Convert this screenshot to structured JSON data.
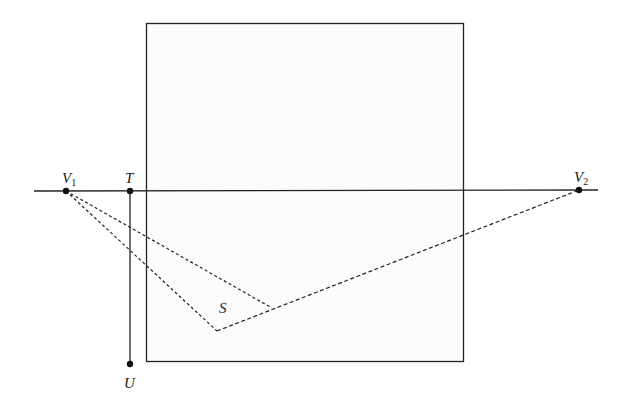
{
  "diagram": {
    "type": "two-point perspective construction",
    "colors": {
      "line": "#222222",
      "frame_fill": "#fcfcfc",
      "background": "#ffffff"
    },
    "labels": {
      "V1": {
        "main": "V",
        "sub": "1"
      },
      "T": {
        "main": "T"
      },
      "V2": {
        "main": "V",
        "sub": "2"
      },
      "S": {
        "main": "S"
      },
      "U": {
        "main": "U"
      }
    },
    "points": {
      "V1": [
        66,
        191
      ],
      "T": [
        130,
        191
      ],
      "U": [
        130,
        364
      ],
      "V2": [
        579,
        190
      ],
      "S_vertex": [
        217,
        331
      ],
      "S_end": [
        272,
        308
      ]
    },
    "frame": {
      "x": 146,
      "y": 23,
      "width": 317,
      "height": 338
    },
    "horizon": {
      "x1": 34,
      "x2": 598,
      "y": 191
    }
  }
}
